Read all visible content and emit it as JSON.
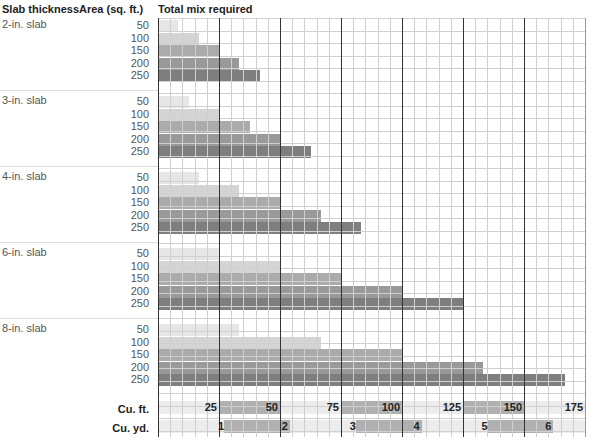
{
  "headers": {
    "col1": "Slab thickness",
    "col2": "Area (sq. ft.)",
    "col3": "Total mix required"
  },
  "groups": [
    {
      "label": "2-in. slab",
      "areas": [
        "50",
        "100",
        "150",
        "200",
        "250"
      ],
      "values": [
        8.3,
        16.7,
        25,
        33.3,
        41.7
      ]
    },
    {
      "label": "3-in. slab",
      "areas": [
        "50",
        "100",
        "150",
        "200",
        "250"
      ],
      "values": [
        12.5,
        25,
        37.5,
        50,
        62.5
      ]
    },
    {
      "label": "4-in. slab",
      "areas": [
        "50",
        "100",
        "150",
        "200",
        "250"
      ],
      "values": [
        16.7,
        33.3,
        50,
        66.7,
        83.3
      ]
    },
    {
      "label": "6-in. slab",
      "areas": [
        "50",
        "100",
        "150",
        "200",
        "250"
      ],
      "values": [
        25,
        50,
        75,
        100,
        125
      ]
    },
    {
      "label": "8-in. slab",
      "areas": [
        "50",
        "100",
        "150",
        "200",
        "250"
      ],
      "values": [
        33.3,
        66.7,
        100,
        133.3,
        166.7
      ]
    }
  ],
  "bar_colors": [
    "#e6e6e6",
    "#d4d4d4",
    "#ababab",
    "#999999",
    "#7e7e7e"
  ],
  "axes": {
    "cuft_label": "Cu. ft.",
    "cuyd_label": "Cu. yd.",
    "cuft_ticks": [
      "25",
      "50",
      "75",
      "100",
      "125",
      "150",
      "175"
    ],
    "cuyd_ticks": [
      "1",
      "2",
      "3",
      "4",
      "5",
      "6"
    ]
  },
  "chart_data": {
    "type": "bar",
    "orientation": "horizontal",
    "title": "Total mix required",
    "xlabel": "Cu. ft. / Cu. yd.",
    "ylabel": "Slab thickness / Area (sq. ft.)",
    "xlim": [
      0,
      175
    ],
    "grid": true,
    "categories": [
      "50",
      "100",
      "150",
      "200",
      "250"
    ],
    "series": [
      {
        "name": "2-in. slab",
        "values": [
          8.3,
          16.7,
          25,
          33.3,
          41.7
        ]
      },
      {
        "name": "3-in. slab",
        "values": [
          12.5,
          25,
          37.5,
          50,
          62.5
        ]
      },
      {
        "name": "4-in. slab",
        "values": [
          16.7,
          33.3,
          50,
          66.7,
          83.3
        ]
      },
      {
        "name": "6-in. slab",
        "values": [
          25,
          50,
          75,
          100,
          125
        ]
      },
      {
        "name": "8-in. slab",
        "values": [
          33.3,
          66.7,
          100,
          133.3,
          166.7
        ]
      }
    ],
    "x_ticks_cuft": [
      25,
      50,
      75,
      100,
      125,
      150,
      175
    ],
    "x_ticks_cuyd": [
      1,
      2,
      3,
      4,
      5,
      6
    ]
  }
}
